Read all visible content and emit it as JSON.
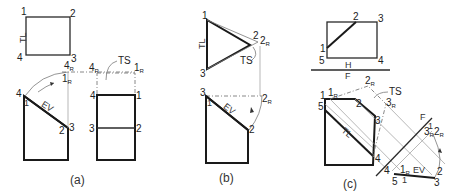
{
  "figure": {
    "panels": [
      {
        "caption": "(a)",
        "top_view": {
          "labels": [
            "1",
            "2",
            "3",
            "4"
          ],
          "line_label": "TL"
        },
        "front_view": {
          "labels": [
            "4",
            "1",
            "2",
            "3"
          ],
          "edge_label": "EV"
        },
        "aux_view": {
          "labels": [
            "4",
            "1",
            "3",
            "2"
          ],
          "rotated_labels": [
            "4",
            "1"
          ],
          "rotated_subscript": "R",
          "callout": "TS"
        }
      },
      {
        "caption": "(b)",
        "top_view": {
          "labels": [
            "1",
            "2",
            "3"
          ],
          "rotated_label": "2",
          "rotated_subscript": "R",
          "line_label": "TL",
          "callout": "TS"
        },
        "front_view": {
          "labels": [
            "3",
            "1",
            "2"
          ],
          "rotated_label": "2",
          "rotated_subscript": "R",
          "edge_label": "EV"
        }
      },
      {
        "caption": "(c)",
        "top_view": {
          "labels": [
            "1",
            "2",
            "3",
            "4",
            "5"
          ],
          "fold_line_top": "H",
          "fold_line_bottom": "F"
        },
        "front_view": {
          "labels": [
            "1",
            "2",
            "3",
            "4",
            "5"
          ],
          "rotated_labels": [
            "1",
            "2",
            "3"
          ],
          "rotated_subscript": "R",
          "line_label": "TL",
          "callout": "TS"
        },
        "edge_view": {
          "fold_line_top": "F",
          "fold_line_bottom": "1",
          "labels": [
            "4",
            "5",
            "1",
            "2",
            "3"
          ],
          "rotated_labels": [
            "1",
            "3",
            "2"
          ],
          "rotated_subscript": "R",
          "edge_label": "EV"
        }
      }
    ]
  }
}
